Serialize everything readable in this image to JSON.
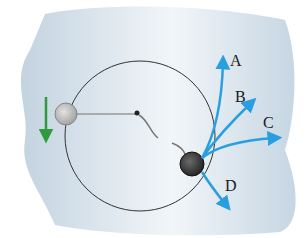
{
  "diagram": {
    "type": "circular-motion",
    "background_color": "#c9d9e6",
    "circle": {
      "cx": 140,
      "cy": 136,
      "r": 75,
      "stroke": "#333333"
    },
    "balls": [
      {
        "name": "ball-left",
        "cx": 66,
        "cy": 114,
        "r": 11,
        "fill": "#b8b8b8"
      },
      {
        "name": "ball-right",
        "cx": 192,
        "cy": 164,
        "r": 12,
        "fill": "#3a3a3a"
      }
    ],
    "velocity_arrow_color": "#2e9b3c",
    "path_arrow_color": "#2a9fe0",
    "labels": {
      "A": "A",
      "B": "B",
      "C": "C",
      "D": "D"
    }
  }
}
